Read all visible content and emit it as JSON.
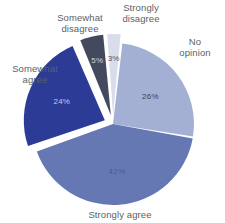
{
  "chart_data": {
    "type": "pie",
    "title": "",
    "xlabel": "",
    "ylabel": "",
    "legend_position": "outside-callout",
    "grid": false,
    "exploded": true,
    "start_angle_deg": 0,
    "direction": "clockwise",
    "categories": [
      "No opinion",
      "Strongly agree",
      "Somewhat agree",
      "Somewhat disagree",
      "Strongly disagree"
    ],
    "values": [
      26,
      42,
      24,
      5,
      3
    ],
    "value_labels": [
      "26%",
      "42%",
      "24%",
      "5%",
      "3%"
    ],
    "colors": [
      "#a4afd4",
      "#6678b4",
      "#2c3b96",
      "#434a5e",
      "#d9dcea"
    ],
    "slices": [
      {
        "label": "No opinion",
        "value": 26,
        "value_label": "26%",
        "color": "#a4afd4",
        "label_text_color": "#3b4152",
        "exploded": false
      },
      {
        "label": "Strongly agree",
        "value": 42,
        "value_label": "42%",
        "color": "#6678b4",
        "label_text_color": "#4a5a94",
        "exploded": false
      },
      {
        "label": "Somewhat agree",
        "value": 24,
        "value_label": "24%",
        "color": "#2c3b96",
        "label_text_color": "#c3c9e4",
        "exploded": true
      },
      {
        "label": "Somewhat disagree",
        "value": 5,
        "value_label": "5%",
        "color": "#434a5e",
        "label_text_color": "#d3d6de",
        "exploded": true
      },
      {
        "label": "Strongly disagree",
        "value": 3,
        "value_label": "3%",
        "color": "#d9dcea",
        "label_text_color": "#4e5362",
        "exploded": true
      }
    ]
  },
  "labels": {
    "no_opinion": "No\nopinion",
    "strongly_agree": "Strongly agree",
    "somewhat_agree": "Somewhat\nagree",
    "somewhat_disagree": "Somewhat\ndisagree",
    "strongly_disagree": "Strongly\ndisagree"
  },
  "percent_labels": {
    "no_opinion": "26%",
    "strongly_agree": "42%",
    "somewhat_agree": "24%",
    "somewhat_disagree": "5%",
    "strongly_disagree": "3%"
  },
  "colors": {
    "no_opinion": "#a4afd4",
    "strongly_agree": "#6678b4",
    "somewhat_agree": "#2c3b96",
    "somewhat_disagree": "#434a5e",
    "strongly_disagree": "#d9dcea",
    "background": "#ffffff",
    "label_text": "#5a5f68"
  }
}
